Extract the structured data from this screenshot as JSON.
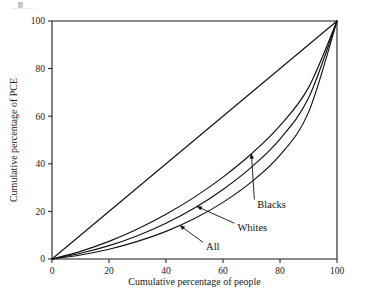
{
  "figure": {
    "background_color": "#ffffff",
    "line_color": "#111111",
    "artifact_label": "page-scan-artifact"
  },
  "chart_data": {
    "type": "line",
    "title": "",
    "subtitle": "",
    "xlabel": "Cumulative percentage of people",
    "ylabel": "Cumulative percentage of PCE",
    "xlim": [
      0,
      100
    ],
    "ylim": [
      0,
      100
    ],
    "xticks": [
      0,
      20,
      40,
      60,
      80,
      100
    ],
    "yticks": [
      0,
      20,
      40,
      60,
      80,
      100
    ],
    "xticklabels": [
      "0",
      "20",
      "40",
      "60",
      "80",
      "100"
    ],
    "yticklabels": [
      "0",
      "20",
      "40",
      "60",
      "80",
      "100"
    ],
    "grid": false,
    "legend_position": "inline-annotations",
    "x": [
      0,
      10,
      20,
      30,
      40,
      50,
      60,
      70,
      80,
      90,
      100
    ],
    "series": [
      {
        "name": "Line of equality",
        "annotation": "",
        "values": [
          0,
          10,
          20,
          30,
          40,
          50,
          60,
          70,
          80,
          90,
          100
        ]
      },
      {
        "name": "Blacks",
        "annotation": "Blacks",
        "values": [
          0,
          3.2,
          7.4,
          12.6,
          18.8,
          26.0,
          34.4,
          44.2,
          56.0,
          72.0,
          100
        ]
      },
      {
        "name": "Whites",
        "annotation": "Whites",
        "values": [
          0,
          2.4,
          5.6,
          9.8,
          15.0,
          21.4,
          29.2,
          38.6,
          50.4,
          67.6,
          100
        ]
      },
      {
        "name": "All",
        "annotation": "All",
        "values": [
          0,
          1.7,
          4.1,
          7.4,
          11.6,
          17.0,
          23.8,
          32.4,
          43.6,
          61.6,
          100
        ]
      }
    ],
    "annotations": [
      {
        "label": "Blacks",
        "x_label": 71,
        "y_label": 25,
        "x_point": 70,
        "y_point": 44
      },
      {
        "label": "Whites",
        "x_label": 64,
        "y_label": 15,
        "x_point": 51,
        "y_point": 22
      },
      {
        "label": "All",
        "x_label": 53,
        "y_label": 7,
        "x_point": 45,
        "y_point": 14
      }
    ]
  }
}
